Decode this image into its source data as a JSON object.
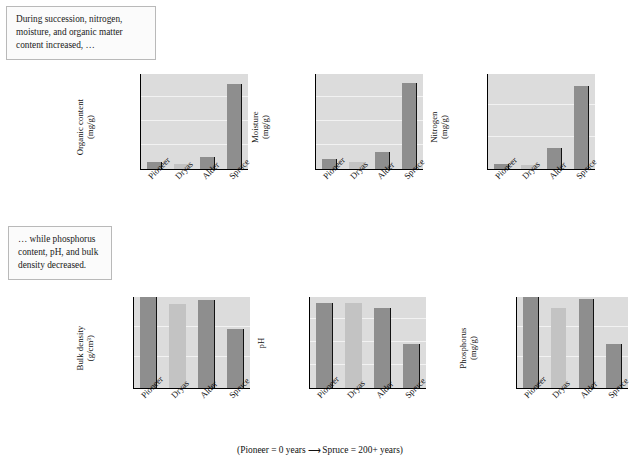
{
  "notes": {
    "top": "During succession, nitrogen, moisture, and organic matter content increased, …",
    "bottom": "… while phosphorus content, pH, and bulk density decreased."
  },
  "caption": {
    "prefix": "(Pioneer = 0 years",
    "arrow": "⟶",
    "suffix": "Spruce = 200+ years)"
  },
  "categories": [
    "Pioneer",
    "Dryas",
    "Alder",
    "Spruce"
  ],
  "colors": {
    "bar_dark": "#8e8e8e",
    "bar_light": "#c3c3c3",
    "plot_background": "#dcdcdc",
    "gridline": "#f2f2f2",
    "axis": "#000000",
    "note_border": "#b9b9b9"
  },
  "chart_data": [
    {
      "type": "bar",
      "id": "organic-content",
      "title": "",
      "xlabel": "",
      "ylabel": "Organic content",
      "yunit": "(mg/g)",
      "categories": [
        "Pioneer",
        "Dryas",
        "Alder",
        "Spruce"
      ],
      "values": [
        7,
        5,
        13,
        89
      ],
      "ylim": [
        0,
        100
      ],
      "yticks": [
        0,
        25,
        50,
        75,
        100
      ],
      "ytick_labels": [
        "0",
        "25",
        "50",
        "75",
        "100"
      ],
      "bar_shades": [
        "dark",
        "light",
        "dark",
        "dark"
      ],
      "grid": true,
      "legend": "none"
    },
    {
      "type": "bar",
      "id": "moisture",
      "title": "",
      "xlabel": "",
      "ylabel": "Moisture",
      "yunit": "(mg/g)",
      "categories": [
        "Pioneer",
        "Dryas",
        "Alder",
        "Spruce"
      ],
      "values": [
        75,
        50,
        125,
        625
      ],
      "ylim": [
        0,
        700
      ],
      "yticks": [
        0,
        175,
        350,
        525,
        700
      ],
      "ytick_labels": [
        "0",
        "175",
        "350",
        "525",
        "700"
      ],
      "bar_shades": [
        "dark",
        "light",
        "dark",
        "dark"
      ],
      "grid": true,
      "legend": "none"
    },
    {
      "type": "bar",
      "id": "nitrogen",
      "title": "",
      "xlabel": "",
      "ylabel": "Nitrogen",
      "yunit": "(mg/g)",
      "categories": [
        "Pioneer",
        "Dryas",
        "Alder",
        "Spruce"
      ],
      "values": [
        0.09,
        0.08,
        0.4,
        1.55
      ],
      "ylim": [
        0,
        1.8
      ],
      "yticks": [
        0,
        0.6,
        1.2,
        1.8
      ],
      "ytick_labels": [
        "0",
        "0.6",
        "1.2",
        "1.8"
      ],
      "bar_shades": [
        "dark",
        "light",
        "dark",
        "dark"
      ],
      "grid": true,
      "legend": "none"
    },
    {
      "type": "bar",
      "id": "bulk-density",
      "title": "",
      "xlabel": "",
      "ylabel": "Bulk density",
      "yunit": "(g/cm³)",
      "categories": [
        "Pioneer",
        "Dryas",
        "Alder",
        "Spruce"
      ],
      "values": [
        1.78,
        1.65,
        1.72,
        1.15
      ],
      "ylim": [
        0,
        1.8
      ],
      "yticks": [
        0,
        0.6,
        1.2,
        1.8
      ],
      "ytick_labels": [
        "0",
        "0.6",
        "1.2",
        "1.8"
      ],
      "bar_shades": [
        "dark",
        "light",
        "dark",
        "dark"
      ],
      "grid": true,
      "legend": "none"
    },
    {
      "type": "bar",
      "id": "ph",
      "title": "",
      "xlabel": "",
      "ylabel": "pH",
      "yunit": "",
      "categories": [
        "Pioneer",
        "Dryas",
        "Alder",
        "Spruce"
      ],
      "values": [
        7.4,
        7.4,
        7.0,
        3.8
      ],
      "ylim": [
        0,
        8
      ],
      "yticks": [
        0,
        2,
        4,
        6,
        8
      ],
      "ytick_labels": [
        "0",
        "2",
        "4",
        "6",
        "8"
      ],
      "bar_shades": [
        "dark",
        "light",
        "dark",
        "dark"
      ],
      "grid": true,
      "legend": "none"
    },
    {
      "type": "bar",
      "id": "phosphorus",
      "title": "",
      "xlabel": "",
      "ylabel": "Phosphorus",
      "yunit": "(mg/g)",
      "categories": [
        "Pioneer",
        "Dryas",
        "Alder",
        "Spruce"
      ],
      "values": [
        0.595,
        0.52,
        0.58,
        0.29
      ],
      "ylim": [
        0,
        0.6
      ],
      "yticks": [
        0,
        0.2,
        0.4,
        0.6
      ],
      "ytick_labels": [
        "0",
        "0.2",
        "0.4",
        "0.6"
      ],
      "bar_shades": [
        "dark",
        "light",
        "dark",
        "dark"
      ],
      "grid": true,
      "legend": "none"
    }
  ]
}
